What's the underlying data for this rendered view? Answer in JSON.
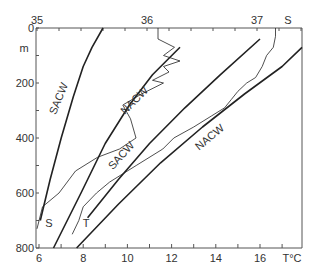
{
  "chart_data": {
    "type": "line",
    "title": "",
    "xlabel_bottom": "T°C",
    "xlabel_top": "S",
    "ylabel": "m",
    "x_bottom_ticks": [
      "6",
      "8",
      "10",
      "12",
      "14",
      "16"
    ],
    "x_top_ticks": [
      "35",
      "36",
      "37"
    ],
    "y_ticks": [
      "0",
      "200",
      "400",
      "600",
      "800"
    ],
    "xlim_bottom": [
      6,
      18
    ],
    "xlim_top": [
      35,
      37.4
    ],
    "ylim": [
      800,
      0
    ],
    "y_inverted": true,
    "grid": false,
    "annotations": [
      {
        "text": "SACW",
        "ref": "salinity reference curve"
      },
      {
        "text": "NACW",
        "ref": "salinity reference curve"
      },
      {
        "text": "SACW",
        "ref": "temperature reference curve"
      },
      {
        "text": "NACW",
        "ref": "temperature reference curve"
      },
      {
        "text": "S",
        "ref": "salinity profile"
      },
      {
        "text": "T",
        "ref": "temperature profile"
      }
    ],
    "series": [
      {
        "name": "SACW (S)",
        "axis": "top",
        "style": "thick",
        "points": [
          [
            35.03,
            700
          ],
          [
            35.12,
            550
          ],
          [
            35.22,
            400
          ],
          [
            35.33,
            250
          ],
          [
            35.42,
            140
          ],
          [
            35.5,
            70
          ],
          [
            35.6,
            0
          ]
        ]
      },
      {
        "name": "NACW (S)",
        "axis": "top",
        "style": "thick",
        "points": [
          [
            35.15,
            800
          ],
          [
            35.4,
            600
          ],
          [
            35.62,
            420
          ],
          [
            35.84,
            280
          ],
          [
            36.05,
            170
          ],
          [
            36.3,
            70
          ]
        ]
      },
      {
        "name": "SACW (T)",
        "axis": "bottom",
        "style": "thick",
        "points": [
          [
            8.2,
            690
          ],
          [
            9.6,
            550
          ],
          [
            11.0,
            420
          ],
          [
            12.6,
            290
          ],
          [
            14.2,
            170
          ],
          [
            16.0,
            40
          ]
        ]
      },
      {
        "name": "NACW (T)",
        "axis": "bottom",
        "style": "thick",
        "points": [
          [
            7.7,
            800
          ],
          [
            9.6,
            640
          ],
          [
            11.5,
            490
          ],
          [
            13.4,
            360
          ],
          [
            15.3,
            240
          ],
          [
            17.0,
            140
          ],
          [
            17.9,
            70
          ]
        ]
      },
      {
        "name": "S profile",
        "axis": "top",
        "style": "thin",
        "points": [
          [
            35.0,
            730
          ],
          [
            35.05,
            650
          ],
          [
            35.2,
            600
          ],
          [
            35.35,
            520
          ],
          [
            35.55,
            470
          ],
          [
            35.75,
            440
          ],
          [
            35.9,
            400
          ],
          [
            35.85,
            330
          ],
          [
            35.78,
            280
          ],
          [
            35.95,
            240
          ],
          [
            36.15,
            200
          ],
          [
            36.05,
            190
          ],
          [
            36.2,
            160
          ],
          [
            36.15,
            140
          ],
          [
            36.3,
            120
          ],
          [
            36.15,
            100
          ],
          [
            36.25,
            70
          ],
          [
            36.1,
            40
          ],
          [
            36.1,
            0
          ]
        ]
      },
      {
        "name": "T profile",
        "axis": "bottom",
        "style": "thin",
        "points": [
          [
            7.5,
            750
          ],
          [
            7.8,
            700
          ],
          [
            8.0,
            650
          ],
          [
            8.6,
            600
          ],
          [
            9.2,
            560
          ],
          [
            10.4,
            500
          ],
          [
            11.6,
            440
          ],
          [
            12.1,
            400
          ],
          [
            13.0,
            360
          ],
          [
            13.8,
            320
          ],
          [
            14.4,
            290
          ],
          [
            14.7,
            260
          ],
          [
            15.0,
            230
          ],
          [
            15.4,
            200
          ],
          [
            15.8,
            180
          ],
          [
            16.1,
            140
          ],
          [
            16.3,
            100
          ],
          [
            16.6,
            70
          ],
          [
            16.7,
            30
          ],
          [
            16.7,
            0
          ]
        ]
      }
    ]
  }
}
